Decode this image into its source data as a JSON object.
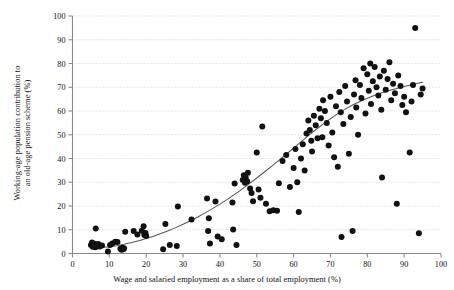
{
  "chart_data": {
    "type": "scatter",
    "title": "",
    "xlabel": "Wage and salaried employment as a share of total employment (%)",
    "ylabel": "Working-age population contribution to\nan old-age pension scheme (%)",
    "xlim": [
      0,
      100
    ],
    "ylim": [
      0,
      100
    ],
    "xticks": [
      0,
      10,
      20,
      30,
      40,
      50,
      60,
      70,
      80,
      90,
      100
    ],
    "yticks": [
      0,
      10,
      20,
      30,
      40,
      50,
      60,
      70,
      80,
      90,
      100
    ],
    "xticklabels": [
      "0",
      "10",
      "20",
      "30",
      "40",
      "50",
      "60",
      "70",
      "80",
      "90",
      "100"
    ],
    "yticklabels": [
      "0",
      "10",
      "20",
      "30",
      "40",
      "50",
      "60",
      "70",
      "80",
      "90",
      "100"
    ],
    "grid": "horizontal-dotted",
    "legend": "none",
    "marker": "filled-circle",
    "marker_color": "#111111",
    "marker_size": 3.0,
    "fit_curve": {
      "name": "fitted trend line",
      "style": "solid",
      "color": "#555555",
      "points": [
        [
          8,
          2.5
        ],
        [
          10,
          2.8
        ],
        [
          12,
          3.3
        ],
        [
          14,
          3.9
        ],
        [
          16,
          4.6
        ],
        [
          18,
          5.4
        ],
        [
          20,
          6.3
        ],
        [
          22,
          7.3
        ],
        [
          24,
          8.4
        ],
        [
          26,
          9.6
        ],
        [
          28,
          10.9
        ],
        [
          30,
          12.3
        ],
        [
          32,
          13.8
        ],
        [
          34,
          15.4
        ],
        [
          36,
          17.1
        ],
        [
          38,
          18.9
        ],
        [
          40,
          20.8
        ],
        [
          42,
          22.8
        ],
        [
          44,
          24.9
        ],
        [
          46,
          27.1
        ],
        [
          48,
          29.4
        ],
        [
          50,
          31.8
        ],
        [
          52,
          34.2
        ],
        [
          54,
          36.7
        ],
        [
          56,
          39.2
        ],
        [
          58,
          41.8
        ],
        [
          60,
          44.4
        ],
        [
          62,
          47.0
        ],
        [
          64,
          49.6
        ],
        [
          66,
          52.1
        ],
        [
          68,
          54.5
        ],
        [
          70,
          56.8
        ],
        [
          72,
          58.9
        ],
        [
          74,
          60.8
        ],
        [
          76,
          62.5
        ],
        [
          78,
          64.0
        ],
        [
          80,
          65.4
        ],
        [
          82,
          66.6
        ],
        [
          84,
          67.7
        ],
        [
          86,
          68.6
        ],
        [
          88,
          69.5
        ],
        [
          90,
          70.3
        ],
        [
          92,
          71.1
        ],
        [
          94,
          71.8
        ],
        [
          95,
          72.1
        ]
      ]
    },
    "points": [
      [
        5.0,
        3.6
      ],
      [
        5.3,
        4.6
      ],
      [
        5.5,
        2.8
      ],
      [
        5.8,
        3.4
      ],
      [
        6.0,
        4.1
      ],
      [
        6.2,
        2.6
      ],
      [
        6.3,
        10.5
      ],
      [
        6.6,
        3.2
      ],
      [
        7.0,
        4.0
      ],
      [
        7.4,
        3.0
      ],
      [
        8.0,
        3.4
      ],
      [
        9.6,
        0.8
      ],
      [
        10.2,
        3.6
      ],
      [
        10.8,
        4.2
      ],
      [
        11.6,
        5.0
      ],
      [
        12.2,
        4.8
      ],
      [
        13.0,
        2.0
      ],
      [
        13.3,
        1.6
      ],
      [
        13.5,
        2.4
      ],
      [
        13.8,
        1.8
      ],
      [
        14.0,
        2.2
      ],
      [
        14.3,
        9.2
      ],
      [
        16.6,
        9.5
      ],
      [
        17.6,
        8.0
      ],
      [
        18.8,
        9.6
      ],
      [
        19.3,
        11.5
      ],
      [
        19.5,
        7.8
      ],
      [
        19.8,
        8.6
      ],
      [
        20.0,
        7.4
      ],
      [
        24.6,
        1.8
      ],
      [
        25.2,
        12.4
      ],
      [
        26.4,
        3.6
      ],
      [
        28.3,
        3.2
      ],
      [
        28.6,
        19.8
      ],
      [
        32.3,
        14.3
      ],
      [
        36.5,
        23.2
      ],
      [
        36.8,
        9.5
      ],
      [
        37.0,
        14.8
      ],
      [
        37.3,
        4.2
      ],
      [
        38.8,
        21.9
      ],
      [
        39.4,
        7.2
      ],
      [
        40.5,
        6.0
      ],
      [
        43.4,
        21.5
      ],
      [
        43.6,
        10.1
      ],
      [
        44.0,
        29.5
      ],
      [
        44.5,
        3.6
      ],
      [
        46.2,
        31.0
      ],
      [
        46.5,
        33.0
      ],
      [
        46.8,
        29.8
      ],
      [
        47.0,
        32.0
      ],
      [
        47.4,
        30.4
      ],
      [
        47.6,
        34.0
      ],
      [
        48.2,
        27.4
      ],
      [
        48.6,
        25.5
      ],
      [
        49.0,
        22.0
      ],
      [
        50.0,
        42.5
      ],
      [
        50.5,
        27.0
      ],
      [
        51.0,
        23.5
      ],
      [
        51.5,
        53.5
      ],
      [
        52.5,
        21.0
      ],
      [
        53.5,
        17.8
      ],
      [
        54.5,
        18.2
      ],
      [
        55.5,
        18.0
      ],
      [
        56.0,
        29.6
      ],
      [
        57.0,
        39.0
      ],
      [
        58.0,
        41.5
      ],
      [
        59.0,
        28.0
      ],
      [
        60.0,
        36.0
      ],
      [
        60.5,
        44.0
      ],
      [
        61.0,
        30.0
      ],
      [
        61.4,
        17.5
      ],
      [
        62.0,
        40.0
      ],
      [
        62.5,
        46.0
      ],
      [
        63.0,
        35.0
      ],
      [
        63.5,
        50.5
      ],
      [
        64.0,
        56.0
      ],
      [
        64.4,
        52.0
      ],
      [
        64.8,
        47.5
      ],
      [
        65.0,
        43.0
      ],
      [
        65.5,
        58.0
      ],
      [
        66.0,
        54.0
      ],
      [
        66.5,
        48.5
      ],
      [
        67.0,
        61.0
      ],
      [
        67.4,
        57.0
      ],
      [
        67.8,
        49.0
      ],
      [
        68.0,
        64.5
      ],
      [
        68.5,
        60.0
      ],
      [
        69.0,
        55.0
      ],
      [
        69.5,
        45.5
      ],
      [
        70.0,
        66.0
      ],
      [
        70.5,
        51.0
      ],
      [
        71.0,
        40.5
      ],
      [
        71.5,
        62.0
      ],
      [
        72.0,
        36.5
      ],
      [
        72.4,
        68.0
      ],
      [
        72.8,
        59.5
      ],
      [
        73.0,
        7.0
      ],
      [
        73.5,
        54.5
      ],
      [
        74.0,
        70.5
      ],
      [
        74.5,
        64.0
      ],
      [
        75.0,
        42.0
      ],
      [
        75.5,
        57.5
      ],
      [
        76.0,
        9.5
      ],
      [
        76.4,
        67.0
      ],
      [
        76.8,
        73.0
      ],
      [
        77.0,
        61.5
      ],
      [
        77.5,
        50.0
      ],
      [
        78.0,
        71.0
      ],
      [
        78.4,
        65.5
      ],
      [
        79.0,
        78.0
      ],
      [
        79.5,
        59.0
      ],
      [
        80.0,
        75.5
      ],
      [
        80.4,
        68.5
      ],
      [
        80.8,
        80.0
      ],
      [
        81.0,
        63.0
      ],
      [
        81.5,
        72.5
      ],
      [
        82.0,
        78.5
      ],
      [
        82.5,
        70.0
      ],
      [
        83.0,
        66.5
      ],
      [
        83.4,
        74.5
      ],
      [
        83.8,
        60.5
      ],
      [
        84.0,
        32.0
      ],
      [
        84.5,
        77.0
      ],
      [
        85.0,
        69.0
      ],
      [
        85.5,
        73.5
      ],
      [
        86.0,
        80.5
      ],
      [
        86.5,
        64.5
      ],
      [
        87.0,
        71.5
      ],
      [
        87.5,
        67.5
      ],
      [
        88.0,
        21.0
      ],
      [
        88.4,
        75.0
      ],
      [
        89.0,
        70.5
      ],
      [
        89.5,
        62.5
      ],
      [
        90.0,
        66.0
      ],
      [
        90.5,
        59.5
      ],
      [
        91.5,
        42.5
      ],
      [
        92.0,
        64.0
      ],
      [
        92.4,
        71.0
      ],
      [
        93.0,
        95.0
      ],
      [
        94.0,
        8.5
      ],
      [
        94.5,
        67.0
      ],
      [
        95.0,
        69.5
      ]
    ]
  },
  "axes": {
    "x_tick_labels": [
      "0",
      "10",
      "20",
      "30",
      "40",
      "50",
      "60",
      "70",
      "80",
      "90",
      "100"
    ],
    "y_tick_labels": [
      "0",
      "10",
      "20",
      "30",
      "40",
      "50",
      "60",
      "70",
      "80",
      "90",
      "100"
    ],
    "x_title": "Wage and salaried employment as a share of total employment (%)",
    "y_title": "Working-age population contribution to\nan old-age pension scheme (%)"
  },
  "colors": {
    "marker": "#111111",
    "curve": "#555555",
    "axis": "#8a8a8a",
    "grid": "#c8c8c8",
    "background": "#ffffff"
  }
}
